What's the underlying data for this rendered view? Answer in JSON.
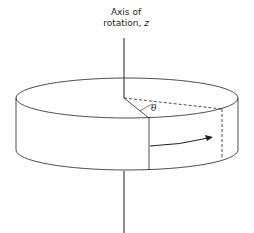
{
  "diagram": {
    "axis_label_line1": "Axis of",
    "axis_label_line2_prefix": "rotation, ",
    "axis_label_variable": "z",
    "angle_label": "θ",
    "stroke_color": "#231f20",
    "background": "#ffffff",
    "elements": [
      "rotation axis (z)",
      "cylinder / disk",
      "radius line to front edge",
      "dashed radius line at angle theta",
      "dashed vertical line on side",
      "curved arrow showing rotation direction"
    ]
  }
}
